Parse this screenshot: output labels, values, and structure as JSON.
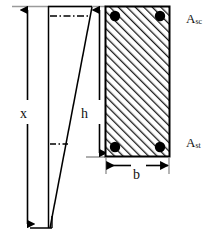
{
  "figure": {
    "type": "engineering-diagram",
    "background_color": "#ffffff",
    "line_color": "#000000",
    "hatch_color": "#1a1a1a",
    "rebar_color": "#000000",
    "caption": ""
  },
  "labels": {
    "neutral_axis_depth": "x",
    "section_depth": "h",
    "section_width": "b",
    "compression_steel": "A",
    "compression_steel_sub": "sc",
    "tension_steel": "A",
    "tension_steel_sub": "st"
  },
  "section": {
    "name": "rectangular-concrete-section",
    "left": 105,
    "top": 6,
    "right": 170,
    "bottom": 157,
    "hatch_pattern": "diagonal-45-up",
    "rebars": [
      {
        "name": "rebar-top-left",
        "cx": 115,
        "cy": 16,
        "r": 5
      },
      {
        "name": "rebar-top-right",
        "cx": 160,
        "cy": 16,
        "r": 5
      },
      {
        "name": "rebar-bottom-left",
        "cx": 115,
        "cy": 147,
        "r": 5
      },
      {
        "name": "rebar-bottom-right",
        "cx": 160,
        "cy": 147,
        "r": 5
      }
    ]
  },
  "strain_diagram": {
    "name": "linear-strain-distribution",
    "top_y": 6,
    "apex_y": 228,
    "left_x": 48,
    "right_x": 92,
    "description": "triangular linear strain profile converging to neutral axis"
  },
  "dimensions": [
    {
      "name": "dimension-x",
      "label": "x",
      "orientation": "vertical",
      "from_y": 6,
      "to_y": 228,
      "at_x": 27
    },
    {
      "name": "dimension-h",
      "label": "h",
      "orientation": "vertical",
      "from_y": 6,
      "to_y": 157,
      "at_x": 99
    },
    {
      "name": "dimension-b",
      "label": "b",
      "orientation": "horizontal",
      "from_x": 105,
      "to_x": 170,
      "at_y": 165
    }
  ]
}
